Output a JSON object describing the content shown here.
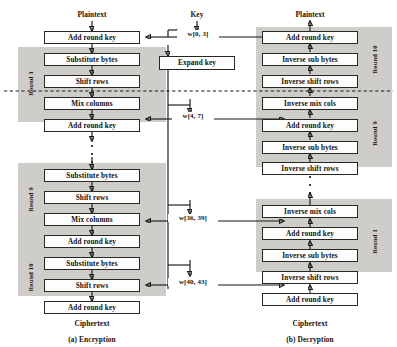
{
  "figure": {
    "caption_left": "(a) Encryption",
    "caption_right": "(b) Decryption",
    "colors": {
      "band": "#cfcdca",
      "box_fill": "#fdfdfd",
      "line": "#1b1815",
      "dashed_divider": "#8d8a86",
      "background": "#ffffff"
    }
  },
  "encryption": {
    "input_label": "Plaintext",
    "output_label": "Ciphertext",
    "initial_step": "Add round key",
    "round1": {
      "label": "Round 1",
      "steps": [
        "Substitute bytes",
        "Shift rows",
        "Mix columns",
        "Add round key"
      ]
    },
    "round9": {
      "label": "Round 9",
      "steps": [
        "Substitute bytes",
        "Shift rows",
        "Mix columns",
        "Add round key"
      ]
    },
    "round10": {
      "label": "Round 10",
      "steps": [
        "Substitute bytes",
        "Shift rows",
        "Add round key"
      ]
    }
  },
  "key_schedule": {
    "input_label": "Key",
    "expand_box": "Expand key",
    "words": [
      "w[0, 3]",
      "w[4, 7]",
      "w[36, 39]",
      "w[40, 43]"
    ]
  },
  "decryption": {
    "input_label": "Ciphertext",
    "output_label": "Plaintext",
    "initial_step": "Add round key",
    "round10": {
      "label": "Round 10",
      "steps": [
        "Add round key",
        "Inverse sub bytes",
        "Inverse shift rows"
      ]
    },
    "round9": {
      "label": "Round 9",
      "steps": [
        "Inverse mix cols",
        "Add round key",
        "Inverse sub bytes",
        "Inverse shift rows"
      ]
    },
    "round1": {
      "label": "Round 1",
      "steps": [
        "Inverse mix cols",
        "Add round key",
        "Inverse sub bytes",
        "Inverse shift rows"
      ]
    }
  }
}
